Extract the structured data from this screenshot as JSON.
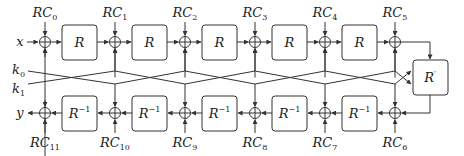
{
  "diagram": {
    "title": "",
    "colors": {
      "stroke": "#333333",
      "box_fill": "#ffffff",
      "text": "#222222"
    },
    "input_label": "x",
    "output_label": "y",
    "key_labels": [
      {
        "base": "k",
        "sub": "0"
      },
      {
        "base": "k",
        "sub": "1"
      }
    ],
    "top_round_label": "R",
    "bottom_round_label": {
      "base": "R",
      "sup": "−1"
    },
    "middle_label": {
      "base": "R",
      "sup": "′"
    },
    "top_constants": [
      {
        "base": "RC",
        "sub": "0"
      },
      {
        "base": "RC",
        "sub": "1"
      },
      {
        "base": "RC",
        "sub": "2"
      },
      {
        "base": "RC",
        "sub": "3"
      },
      {
        "base": "RC",
        "sub": "4"
      },
      {
        "base": "RC",
        "sub": "5"
      }
    ],
    "bottom_constants": [
      {
        "base": "RC",
        "sub": "11"
      },
      {
        "base": "RC",
        "sub": "10"
      },
      {
        "base": "RC",
        "sub": "9"
      },
      {
        "base": "RC",
        "sub": "8"
      },
      {
        "base": "RC",
        "sub": "7"
      },
      {
        "base": "RC",
        "sub": "6"
      }
    ],
    "top_rounds_count": 5,
    "bottom_rounds_count": 5
  }
}
